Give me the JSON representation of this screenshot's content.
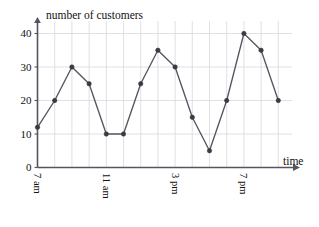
{
  "chart_data": {
    "type": "line",
    "title": "",
    "xlabel": "time",
    "ylabel": "number of customers",
    "x": [
      "7 am",
      "8 am",
      "9 am",
      "10 am",
      "11 am",
      "12 pm",
      "1 pm",
      "2 pm",
      "3 pm",
      "4 pm",
      "5 pm",
      "6 pm",
      "7 pm",
      "8 pm",
      "9 pm"
    ],
    "values": [
      12,
      20,
      30,
      25,
      10,
      10,
      25,
      35,
      30,
      15,
      5,
      20,
      40,
      35,
      20
    ],
    "series": [
      {
        "name": "number of customers",
        "values": [
          12,
          20,
          30,
          25,
          10,
          10,
          25,
          35,
          30,
          15,
          5,
          20,
          40,
          35,
          20
        ]
      }
    ],
    "x_tick_labels": [
      "7 am",
      "11 am",
      "3 pm",
      "7 pm"
    ],
    "x_tick_indices": [
      0,
      4,
      8,
      12
    ],
    "y_tick_labels": [
      "0",
      "10",
      "20",
      "30",
      "40"
    ],
    "y_ticks": [
      0,
      10,
      20,
      30,
      40
    ],
    "ylim": [
      0,
      43
    ],
    "xlim": [
      -0.6,
      15.2
    ],
    "grid": true,
    "grid_color": "#d8d8e0",
    "legend": "none",
    "line_color": "#555560",
    "marker_color": "#3a3a42",
    "axis_color": "#555560"
  },
  "axes": {
    "y_axis_title": "number of customers",
    "x_axis_title": "time"
  }
}
